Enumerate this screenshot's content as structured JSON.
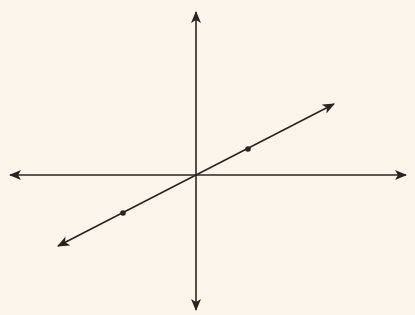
{
  "diagram": {
    "title": "",
    "background": "#fbf5ec",
    "stroke_color": "#2a2522",
    "axes": {
      "origin": [
        196,
        175
      ],
      "x_axis": {
        "from": [
          10,
          175
        ],
        "to": [
          406,
          175
        ],
        "arrows": "both"
      },
      "y_axis": {
        "from": [
          196,
          12
        ],
        "to": [
          196,
          310
        ],
        "arrows": "both"
      }
    },
    "line": {
      "from": [
        58,
        246
      ],
      "to": [
        334,
        104
      ],
      "arrows": "both",
      "passes_through_origin": true,
      "slope_direction": "positive"
    },
    "points": [
      {
        "name": "point-upper-right",
        "x": 248,
        "y": 149
      },
      {
        "name": "point-lower-left",
        "x": 123,
        "y": 213
      }
    ],
    "labels": []
  }
}
